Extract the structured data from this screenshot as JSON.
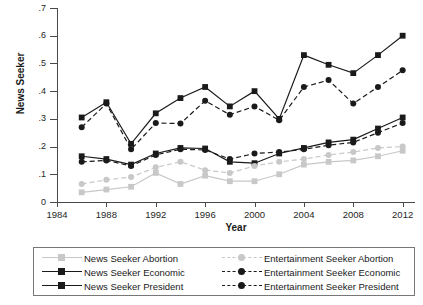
{
  "chart_data": {
    "type": "line",
    "title": "",
    "xlabel": "Year",
    "ylabel": "News Seeker",
    "xlim": [
      1984,
      2013
    ],
    "ylim": [
      0,
      0.7
    ],
    "grid": false,
    "legend_position": "bottom",
    "xticks": [
      "1984",
      "1988",
      "1992",
      "1996",
      "2000",
      "2004",
      "2008",
      "2012"
    ],
    "xtick_values": [
      1984,
      1988,
      1992,
      1996,
      2000,
      2004,
      2008,
      2012
    ],
    "yticks": [
      "0",
      ".1",
      ".2",
      ".3",
      ".4",
      ".5",
      ".6",
      ".7"
    ],
    "ytick_values": [
      0,
      0.1,
      0.2,
      0.3,
      0.4,
      0.5,
      0.6,
      0.7
    ],
    "x": [
      1986,
      1988,
      1990,
      1992,
      1994,
      1996,
      1998,
      2000,
      2002,
      2004,
      2006,
      2008,
      2010,
      2012
    ],
    "series": [
      {
        "name": "News Seeker Abortion",
        "color": "#c8c8c8",
        "dash": "solid",
        "marker": "square",
        "values": [
          0.035,
          0.045,
          0.055,
          0.105,
          0.065,
          0.095,
          0.075,
          0.075,
          0.1,
          0.135,
          0.145,
          0.15,
          0.165,
          0.185
        ]
      },
      {
        "name": "News Seeker Economic",
        "color": "#1a1a1a",
        "dash": "solid",
        "marker": "square",
        "values": [
          0.165,
          0.155,
          0.135,
          0.175,
          0.195,
          0.193,
          0.145,
          0.14,
          0.175,
          0.195,
          0.215,
          0.225,
          0.265,
          0.305
        ]
      },
      {
        "name": "News Seeker President",
        "color": "#1a1a1a",
        "dash": "solid",
        "marker": "square",
        "values": [
          0.305,
          0.36,
          0.21,
          0.32,
          0.375,
          0.415,
          0.345,
          0.4,
          0.3,
          0.53,
          0.495,
          0.465,
          0.53,
          0.6
        ]
      },
      {
        "name": "Entertainment Seeker Abortion",
        "color": "#c8c8c8",
        "dash": "dashed",
        "marker": "circle",
        "values": [
          0.065,
          0.08,
          0.09,
          0.125,
          0.145,
          0.115,
          0.105,
          0.13,
          0.145,
          0.155,
          0.17,
          0.18,
          0.195,
          0.2
        ]
      },
      {
        "name": "Entertainment Seeker Economic",
        "color": "#1a1a1a",
        "dash": "dashed",
        "marker": "circle",
        "values": [
          0.145,
          0.15,
          0.13,
          0.17,
          0.19,
          0.188,
          0.155,
          0.175,
          0.18,
          0.19,
          0.205,
          0.215,
          0.25,
          0.285
        ]
      },
      {
        "name": "Entertainment Seeker President",
        "color": "#1a1a1a",
        "dash": "dashed",
        "marker": "circle",
        "values": [
          0.27,
          0.355,
          0.19,
          0.285,
          0.283,
          0.365,
          0.315,
          0.345,
          0.295,
          0.415,
          0.44,
          0.355,
          0.415,
          0.475
        ]
      }
    ]
  },
  "axes": {
    "x_title": "Year",
    "y_title": "News Seeker"
  },
  "legend": {
    "news_column": [
      {
        "label": "News Seeker Abortion",
        "color": "#c8c8c8",
        "dash": "solid",
        "marker": "square"
      },
      {
        "label": "News Seeker Economic",
        "color": "#1a1a1a",
        "dash": "solid",
        "marker": "square"
      },
      {
        "label": "News Seeker President",
        "color": "#1a1a1a",
        "dash": "solid",
        "marker": "square"
      }
    ],
    "entertainment_column": [
      {
        "label": "Entertainment Seeker Abortion",
        "color": "#c8c8c8",
        "dash": "dashed",
        "marker": "circle"
      },
      {
        "label": "Entertainment Seeker Economic",
        "color": "#1a1a1a",
        "dash": "dashed",
        "marker": "circle"
      },
      {
        "label": "Entertainment Seeker President",
        "color": "#1a1a1a",
        "dash": "dashed",
        "marker": "circle"
      }
    ]
  }
}
